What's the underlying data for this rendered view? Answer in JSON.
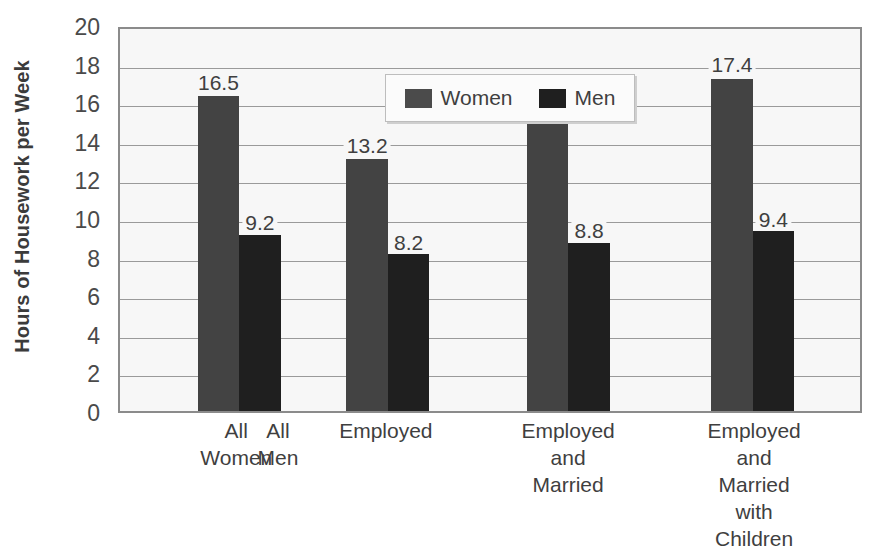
{
  "chart_data": {
    "type": "bar",
    "title": "",
    "subtitle": "",
    "xlabel": "",
    "ylabel": "Hours of Housework per Week",
    "ylim": [
      0,
      20
    ],
    "y_ticks": [
      0,
      2,
      4,
      6,
      8,
      10,
      12,
      14,
      16,
      18,
      20
    ],
    "grid": true,
    "legend_position": "top-center-inside",
    "categories": [
      "All\nWomen",
      "Employed",
      "Employed\nand\nMarried",
      "Employed and\nMarried with\nChildren"
    ],
    "category_labels_render": [
      {
        "text": "All\nWomen",
        "center_pct": 15.9
      },
      {
        "text": "All\nMen",
        "center_pct": 21.5
      },
      {
        "text": "Employed",
        "center_pct": 36.0
      },
      {
        "text": "Employed\nand\nMarried",
        "center_pct": 60.5
      },
      {
        "text": "Employed and\nMarried with\nChildren",
        "center_pct": 85.5
      }
    ],
    "series": [
      {
        "name": "Women",
        "color": "#434343",
        "values": [
          16.5,
          13.2,
          15.7,
          17.4
        ],
        "value_labels": [
          "16.5",
          "13.2",
          "15.7",
          "17.4"
        ]
      },
      {
        "name": "Men",
        "color": "#1f1f1f",
        "values": [
          9.2,
          8.2,
          8.8,
          9.4
        ],
        "value_labels": [
          "9.2",
          "8.2",
          "8.8",
          "9.4"
        ]
      }
    ],
    "bar_geometry": [
      {
        "series": "Women",
        "index": 0,
        "left_pct": 10.5,
        "width_pct": 5.6
      },
      {
        "series": "Men",
        "index": 0,
        "left_pct": 16.1,
        "width_pct": 5.6
      },
      {
        "series": "Women",
        "index": 1,
        "left_pct": 30.6,
        "width_pct": 5.6
      },
      {
        "series": "Men",
        "index": 1,
        "left_pct": 36.2,
        "width_pct": 5.6
      },
      {
        "series": "Women",
        "index": 2,
        "left_pct": 55.0,
        "width_pct": 5.6
      },
      {
        "series": "Men",
        "index": 2,
        "left_pct": 60.6,
        "width_pct": 5.6
      },
      {
        "series": "Women",
        "index": 3,
        "left_pct": 79.9,
        "width_pct": 5.6
      },
      {
        "series": "Men",
        "index": 3,
        "left_pct": 85.5,
        "width_pct": 5.6
      }
    ]
  },
  "legend": {
    "entries": [
      {
        "label": "Women",
        "swatch": "women"
      },
      {
        "label": "Men",
        "swatch": "men"
      }
    ]
  },
  "colors": {
    "women_bar": "#434343",
    "men_bar": "#1f1f1f",
    "plot_background": "#f7f7f7",
    "gridline": "#9a9a9a",
    "axis_border": "#8b8b8b",
    "text": "#3f3f3f"
  }
}
